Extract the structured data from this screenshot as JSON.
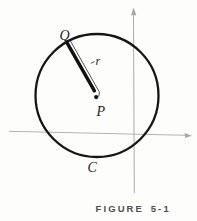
{
  "figure": {
    "caption": "FIGURE 5-1",
    "labels": {
      "point_Q": "Q",
      "radius_r": "r",
      "center_P": "P",
      "circle_C": "C"
    },
    "colors": {
      "background": "#fdfdfb",
      "ink": "#161616",
      "axis_gray": "#ababab",
      "caption_gray": "#4f4f4f"
    }
  }
}
